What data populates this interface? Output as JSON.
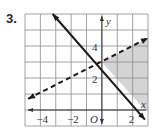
{
  "problem_number": "3.",
  "chart_data": {
    "type": "line",
    "title": "",
    "xlabel": "x",
    "ylabel": "y",
    "origin_label": "O",
    "xlim": [
      -5,
      3
    ],
    "ylim": [
      -1,
      6
    ],
    "grid": true,
    "x_tick_labels": [
      {
        "value": -4,
        "label": "−4"
      },
      {
        "value": -2,
        "label": "−2"
      },
      {
        "value": 2,
        "label": "2"
      }
    ],
    "y_tick_labels": [
      {
        "value": 2,
        "label": "2"
      },
      {
        "value": 4,
        "label": "4"
      }
    ],
    "series": [
      {
        "name": "solid boundary",
        "equation": "y = -x + 3",
        "style": "solid",
        "x": [
          -3.2,
          2.8
        ],
        "y": [
          6.0,
          -0.6
        ],
        "color": "#1a1a1a"
      },
      {
        "name": "dashed boundary",
        "equation": "y = 0.5x + 3",
        "style": "dashed",
        "x": [
          -4.8,
          3.0
        ],
        "y": [
          0.7,
          4.5
        ],
        "color": "#1a1a1a"
      }
    ],
    "shaded_region": {
      "description": "x >= 0, y >= 0, above solid line, below dashed line",
      "vertices": [
        [
          0,
          3
        ],
        [
          3,
          4.5
        ],
        [
          3,
          0
        ],
        [
          2.8,
          0
        ]
      ],
      "color": "#d4d4d4"
    }
  }
}
